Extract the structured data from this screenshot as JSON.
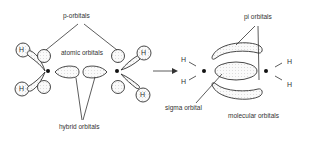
{
  "labels": {
    "p_orbitals": "p-orbitals",
    "atomic_orbitals": "atomic orbitals",
    "hybrid_orbitals": "hybrid orbitals",
    "pi_orbitals": "pi orbitals",
    "sigma_orbital": "sigma orbital",
    "molecular_orbitals": "molecular orbitals"
  },
  "atoms": {
    "hydrogen": "H"
  },
  "colors": {
    "line": "#333333",
    "fill": "#f4f4f4",
    "background": "#ffffff"
  }
}
